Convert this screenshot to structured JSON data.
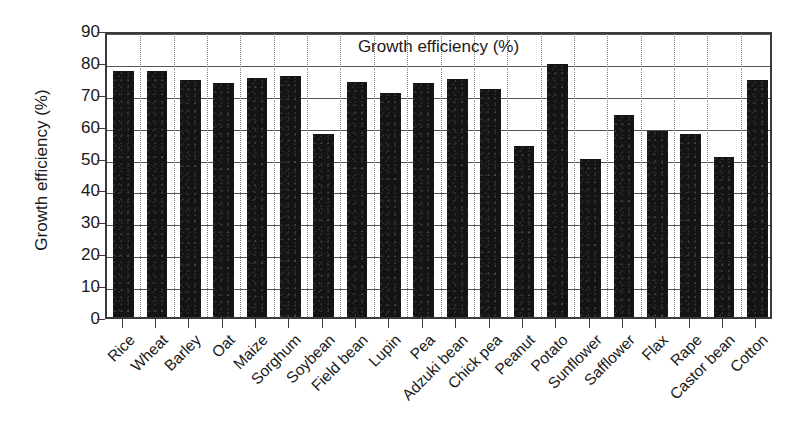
{
  "chart_data": {
    "type": "bar",
    "title": "Growth efficiency (%)",
    "xlabel": "",
    "ylabel": "Growth efficiency (%)",
    "ylim": [
      0,
      90
    ],
    "ytick_values": [
      0,
      10,
      20,
      30,
      40,
      50,
      60,
      70,
      80,
      90
    ],
    "ytick_labels": [
      "0",
      "10",
      "20",
      "30",
      "40",
      "50",
      "60",
      "70",
      "80",
      "90"
    ],
    "grid": "horizontal solid, vertical dotted",
    "legend": "none",
    "bar_color": "#141414",
    "categories": [
      "Rice",
      "Wheat",
      "Barley",
      "Oat",
      "Maize",
      "Sorghum",
      "Soybean",
      "Field bean",
      "Lupin",
      "Pea",
      "Adzuki bean",
      "Chick pea",
      "Peanut",
      "Potato",
      "Sunflower",
      "Safflower",
      "Flax",
      "Rape",
      "Castor bean",
      "Cotton"
    ],
    "values": [
      77.0,
      77.0,
      74.3,
      73.5,
      74.8,
      75.6,
      57.4,
      73.8,
      70.3,
      73.5,
      74.5,
      71.6,
      53.7,
      79.2,
      49.4,
      63.2,
      58.2,
      57.3,
      50.3,
      74.4
    ]
  }
}
